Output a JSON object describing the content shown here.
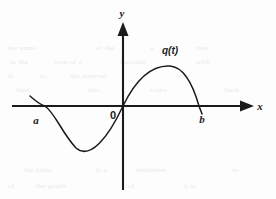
{
  "figure": {
    "kind": "cartesian-plot-sketch",
    "background_color": "#fdfdfd",
    "ink_color": "#1b1b1b",
    "labels": {
      "x_axis": "x",
      "y_axis": "y",
      "origin": "0",
      "left_root": "a",
      "right_root": "b",
      "curve": "q(t)"
    },
    "ghost_text": [
      {
        "text": "the same",
        "x": 8,
        "y": 44
      },
      {
        "text": "of the",
        "x": 96,
        "y": 44
      },
      {
        "text": "a",
        "x": 150,
        "y": 44
      },
      {
        "text": "and",
        "x": 196,
        "y": 44
      },
      {
        "text": "in the",
        "x": 10,
        "y": 58
      },
      {
        "text": "case of a",
        "x": 54,
        "y": 58
      },
      {
        "text": "function",
        "x": 120,
        "y": 58
      },
      {
        "text": "with",
        "x": 196,
        "y": 58
      },
      {
        "text": "is",
        "x": 8,
        "y": 72
      },
      {
        "text": "to",
        "x": 40,
        "y": 72
      },
      {
        "text": "the interval",
        "x": 70,
        "y": 72
      },
      {
        "text": "over",
        "x": 176,
        "y": 72
      },
      {
        "text": "then",
        "x": 16,
        "y": 86
      },
      {
        "text": "this",
        "x": 88,
        "y": 86
      },
      {
        "text": "value",
        "x": 150,
        "y": 86
      },
      {
        "text": "Such",
        "x": 224,
        "y": 86
      },
      {
        "text": "the point",
        "x": 24,
        "y": 166
      },
      {
        "text": "is a",
        "x": 96,
        "y": 166
      },
      {
        "text": "minimum",
        "x": 136,
        "y": 166
      },
      {
        "text": "so",
        "x": 232,
        "y": 166
      },
      {
        "text": "of",
        "x": 8,
        "y": 182
      },
      {
        "text": "the graph",
        "x": 36,
        "y": 182
      },
      {
        "text": "of",
        "x": 128,
        "y": 182
      },
      {
        "text": "q at",
        "x": 184,
        "y": 182
      }
    ]
  },
  "chart_data": {
    "type": "line",
    "title": "",
    "xlabel": "x",
    "ylabel": "y",
    "grid": false,
    "legend": "none",
    "annotations": [
      {
        "label": "a",
        "role": "left-x-intercept"
      },
      {
        "label": "0",
        "role": "origin"
      },
      {
        "label": "b",
        "role": "right-x-intercept"
      },
      {
        "label": "q(t)",
        "role": "curve-name"
      }
    ],
    "series": [
      {
        "name": "q(t)",
        "roots": [
          "a",
          "0",
          "b"
        ],
        "shape": "cubic-like s-curve: negative lobe on [a,0], positive lobe on [0,b]",
        "points": [
          {
            "x": -5.2,
            "y": 0.45
          },
          {
            "x": -4.0,
            "y": 0.0
          },
          {
            "x": -3.0,
            "y": -0.55
          },
          {
            "x": -2.2,
            "y": -0.78
          },
          {
            "x": -1.6,
            "y": -0.82
          },
          {
            "x": -1.0,
            "y": -0.7
          },
          {
            "x": -0.5,
            "y": -0.4
          },
          {
            "x": 0.0,
            "y": 0.0
          },
          {
            "x": 0.8,
            "y": 0.5
          },
          {
            "x": 1.6,
            "y": 0.88
          },
          {
            "x": 2.2,
            "y": 1.0
          },
          {
            "x": 2.8,
            "y": 0.96
          },
          {
            "x": 3.4,
            "y": 0.72
          },
          {
            "x": 4.0,
            "y": 0.3
          },
          {
            "x": 4.4,
            "y": 0.0
          }
        ]
      }
    ]
  }
}
